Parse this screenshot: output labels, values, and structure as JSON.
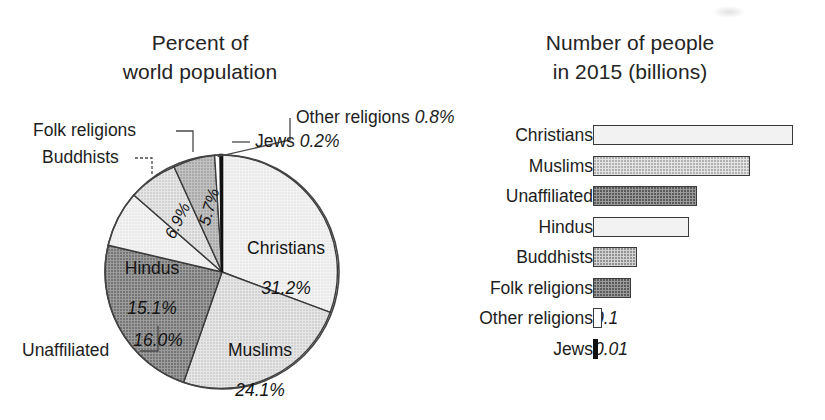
{
  "pie_panel": {
    "title": "Percent of\nworld population",
    "callouts": [
      {
        "name": "Other religions",
        "value": "0.8%"
      },
      {
        "name": "Jews",
        "value": "0.2%"
      },
      {
        "name": "Folk religions",
        "value": ""
      },
      {
        "name": "Buddhists",
        "value": ""
      },
      {
        "name": "Unaffiliated",
        "value": ""
      }
    ],
    "inline_labels": [
      {
        "name": "Christians",
        "pct": "31.2%"
      },
      {
        "name": "Muslims",
        "pct": "24.1%"
      },
      {
        "name": "Hindus",
        "pct": "15.1%"
      },
      {
        "name": "",
        "pct": "16.0%"
      },
      {
        "name": "",
        "pct": "6.9%"
      },
      {
        "name": "",
        "pct": "5.7%"
      }
    ]
  },
  "bar_panel": {
    "title": "Number of people\nin 2015 (billions)"
  },
  "chart_data": [
    {
      "type": "pie",
      "title": "Percent of world population",
      "unit": "percent",
      "categories": [
        "Christians",
        "Muslims",
        "Unaffiliated",
        "Hindus",
        "Buddhists",
        "Folk religions",
        "Other religions",
        "Jews"
      ],
      "values": [
        31.2,
        24.1,
        16.0,
        15.1,
        6.9,
        5.7,
        0.8,
        0.2
      ],
      "value_labels": [
        "31.2%",
        "24.1%",
        "16.0%",
        "15.1%",
        "6.9%",
        "5.7%",
        "0.8%",
        "0.2%"
      ],
      "slice_fills": [
        "#f2f2f2",
        "#e3e3e3",
        "#9a9a9a",
        "#f2f2f2",
        "#e3e3e3",
        "#b4b4b4",
        "#ffffff",
        "#111111"
      ],
      "label_placement": [
        "inside",
        "inside",
        "inside-callout",
        "inside",
        "callout",
        "callout",
        "callout",
        "callout"
      ],
      "start_angle_deg": 0,
      "direction": "clockwise",
      "legend": "none"
    },
    {
      "type": "bar",
      "orientation": "horizontal",
      "title": "Number of people in 2015 (billions)",
      "xlabel": "",
      "ylabel": "",
      "unit": "billions",
      "categories": [
        "Christians",
        "Muslims",
        "Unaffiliated",
        "Hindus",
        "Buddhists",
        "Folk religions",
        "Other religions",
        "Jews"
      ],
      "values": [
        2.3,
        1.8,
        1.2,
        1.1,
        0.5,
        0.4,
        0.1,
        0.01
      ],
      "value_labels": [
        "2.3",
        "1.8",
        "1.2",
        "1.1",
        "0.5",
        "0.4",
        "0.1",
        "0.01"
      ],
      "bar_fills": [
        "#f2f2f2",
        "#e3e3e3",
        "#9a9a9a",
        "#f2f2f2",
        "#d2d2d2",
        "#9a9a9a",
        "#ffffff",
        "#111111"
      ],
      "xlim": [
        0,
        2.3
      ],
      "grid": false,
      "legend": "none"
    }
  ],
  "bars": [
    {
      "label": "Christians",
      "value": "2.3",
      "width_px": 200,
      "fill": "fill-lightest"
    },
    {
      "label": "Muslims",
      "value": "1.8",
      "width_px": 157,
      "fill": "fill-light"
    },
    {
      "label": "Unaffiliated",
      "value": "1.2",
      "width_px": 104,
      "fill": "fill-dark"
    },
    {
      "label": "Hindus",
      "value": "1.1",
      "width_px": 96,
      "fill": "fill-lightest"
    },
    {
      "label": "Buddhists",
      "value": "0.5",
      "width_px": 44,
      "fill": "fill-medium"
    },
    {
      "label": "Folk religions",
      "value": "0.4",
      "width_px": 38,
      "fill": "fill-dark"
    },
    {
      "label": "Other religions",
      "value": "0.1",
      "width_px": 9,
      "fill": "fill-white"
    },
    {
      "label": "Jews",
      "value": "0.01",
      "width_px": 5,
      "fill": "fill-black"
    }
  ]
}
